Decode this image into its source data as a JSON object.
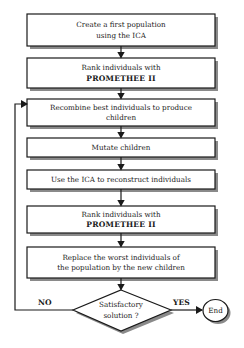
{
  "flowchart": {
    "steps": [
      {
        "id": "create-population",
        "lines": [
          "Create a first population",
          "using the ICA"
        ]
      },
      {
        "id": "rank-1",
        "lines": [
          "Rank individuals with",
          "PROMETHEE II"
        ]
      },
      {
        "id": "recombine",
        "lines": [
          "Recombine best individuals to produce",
          "children"
        ]
      },
      {
        "id": "mutate",
        "lines": [
          "Mutate children"
        ]
      },
      {
        "id": "reconstruct",
        "lines": [
          "Use the ICA to reconstruct individuals"
        ]
      },
      {
        "id": "rank-2",
        "lines": [
          "Rank individuals with",
          "PROMETHEE II"
        ]
      },
      {
        "id": "replace",
        "lines": [
          "Replace the worst individuals of",
          "the population by the new children"
        ]
      }
    ],
    "decision": {
      "lines": [
        "Satisfactory",
        "solution ?"
      ]
    },
    "no_label": "NO",
    "yes_label": "YES",
    "end_label": "End"
  },
  "colors": {
    "stroke": "#1a1a1a",
    "shadow": "#8a8a8a",
    "fill": "#ffffff"
  }
}
